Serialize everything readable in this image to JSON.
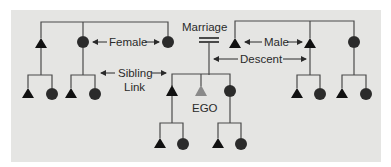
{
  "diagram": {
    "type": "kinship-chart",
    "labels": {
      "female": "Female",
      "male": "Male",
      "marriage": "Marriage",
      "sibling_link_line1": "Sibling",
      "sibling_link_line2": "Link",
      "descent": "Descent",
      "ego": "EGO"
    },
    "symbols": {
      "male": "triangle",
      "female": "circle",
      "ego": "gray-triangle",
      "marriage": "double-horizontal-line"
    },
    "colors": {
      "background": "#e5e5e3",
      "symbol": "#111111",
      "ego": "#8a8a8a",
      "line": "#4a4a4a"
    }
  }
}
